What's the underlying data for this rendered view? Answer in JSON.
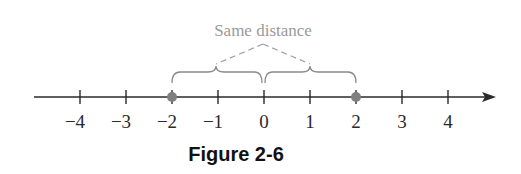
{
  "figure": {
    "caption": "Figure 2-6",
    "annotation": "Same distance",
    "colors": {
      "axis": "#2a2a2a",
      "annotation": "#9a9a9a",
      "point": "#7f7f7f"
    }
  },
  "number_line": {
    "ticks": [
      {
        "value": -4,
        "label": "−4"
      },
      {
        "value": -3,
        "label": "−3"
      },
      {
        "value": -2,
        "label": "−2"
      },
      {
        "value": -1,
        "label": "−1"
      },
      {
        "value": 0,
        "label": "0"
      },
      {
        "value": 1,
        "label": "1"
      },
      {
        "value": 2,
        "label": "2"
      },
      {
        "value": 3,
        "label": "3"
      },
      {
        "value": 4,
        "label": "4"
      }
    ],
    "points": [
      -2,
      2
    ],
    "braces": [
      {
        "from": -2,
        "to": 0
      },
      {
        "from": 0,
        "to": 2
      }
    ],
    "arrow": "right"
  }
}
